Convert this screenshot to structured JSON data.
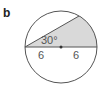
{
  "figure": {
    "label": "b",
    "angle_label": "30°",
    "segment_left_label": "6",
    "segment_right_label": "6",
    "colors": {
      "stroke": "#555555",
      "shade": "#d9d9d9",
      "center_dot": "#333333"
    }
  }
}
